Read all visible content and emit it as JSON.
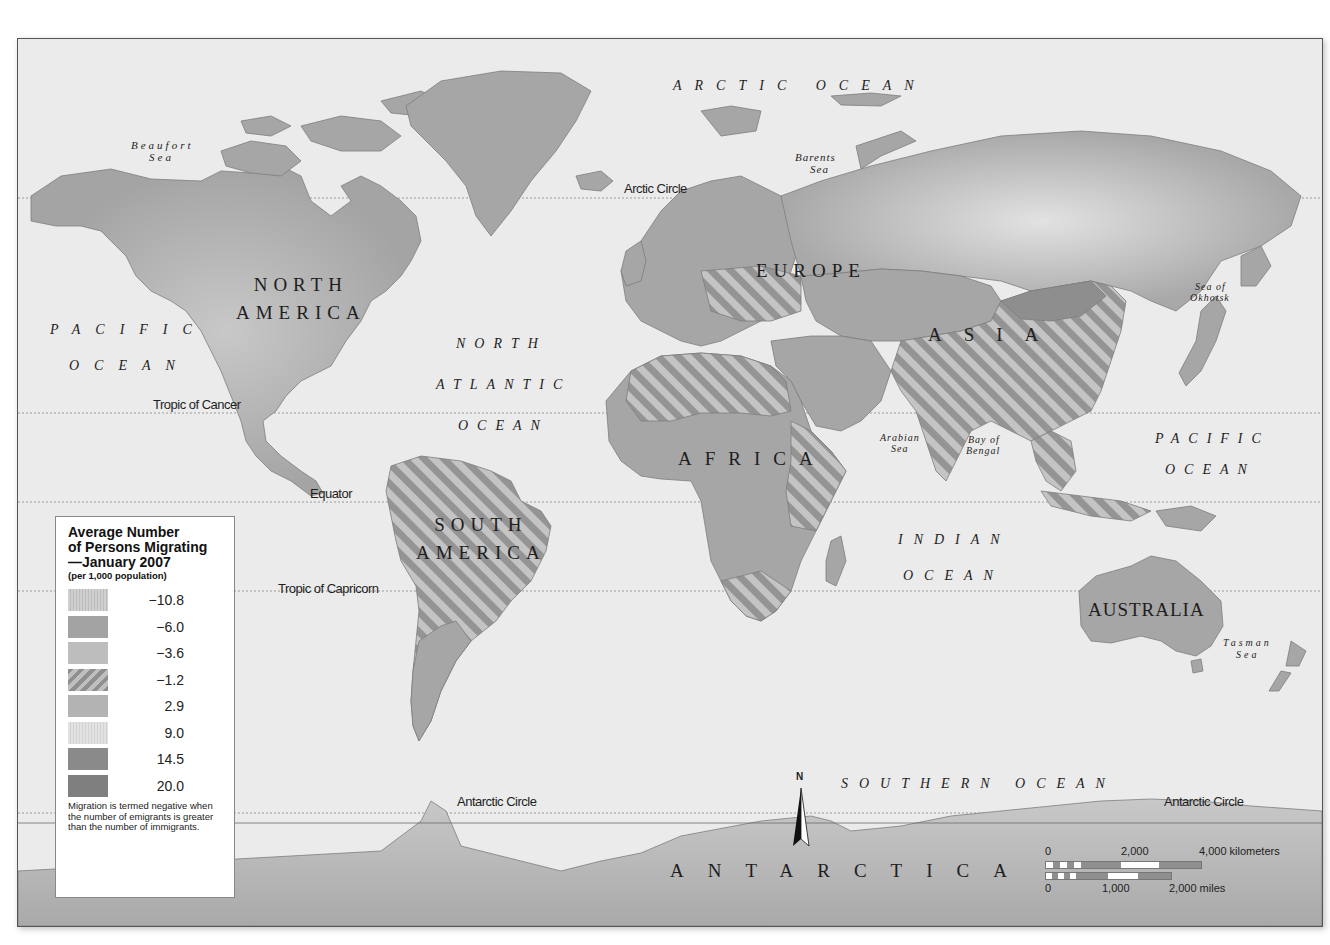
{
  "map": {
    "colors": {
      "ocean": "#ebebeb",
      "land": "#a6a6a6",
      "land_dark": "#8c8c8c",
      "hatch_light": "#c6c6c6",
      "hatch_dark": "#8f8f8f",
      "border": "#f0f0f0",
      "frame": "#555555"
    },
    "continents": {
      "north_america": "NORTH\nAMERICA",
      "south_america": "SOUTH\nAMERICA",
      "europe": "EUROPE",
      "asia": "ASIA",
      "africa": "AFRICA",
      "australia": "AUSTRALIA",
      "antarctica": "ANTARCTICA"
    },
    "oceans": {
      "arctic": "ARCTIC OCEAN",
      "pacific_west_1": "PACIFIC",
      "pacific_west_2": "OCEAN",
      "north_atlantic_1": "NORTH",
      "north_atlantic_2": "ATLANTIC",
      "north_atlantic_3": "OCEAN",
      "indian_1": "INDIAN",
      "indian_2": "OCEAN",
      "pacific_east_1": "PACIFIC",
      "pacific_east_2": "OCEAN",
      "southern": "SOUTHERN OCEAN"
    },
    "seas": {
      "beaufort_1": "Beaufort",
      "beaufort_2": "Sea",
      "barents_1": "Barents",
      "barents_2": "Sea",
      "okhotsk_1": "Sea of",
      "okhotsk_2": "Okhotsk",
      "arabian_1": "Arabian",
      "arabian_2": "Sea",
      "bengal_1": "Bay of",
      "bengal_2": "Bengal",
      "tasman_1": "Tasman",
      "tasman_2": "Sea"
    },
    "lines": {
      "arctic_circle": "Arctic Circle",
      "tropic_cancer": "Tropic of Cancer",
      "equator": "Equator",
      "tropic_capricorn": "Tropic of Capricorn",
      "antarctic_circle_west": "Antarctic Circle",
      "antarctic_circle_east": "Antarctic Circle"
    },
    "north_arrow": "N"
  },
  "legend": {
    "title_1": "Average Number",
    "title_2": "of Persons Migrating",
    "title_3": "—January 2007",
    "subtitle": "(per 1,000 population)",
    "items": [
      {
        "value": "−10.8",
        "pattern": "fine-light"
      },
      {
        "value": "−6.0",
        "pattern": "solid-medium"
      },
      {
        "value": "−3.6",
        "pattern": "solid-light"
      },
      {
        "value": "−1.2",
        "pattern": "diagonal-hatch"
      },
      {
        "value": "2.9",
        "pattern": "solid-mid-light"
      },
      {
        "value": "9.0",
        "pattern": "fine-very-light"
      },
      {
        "value": "14.5",
        "pattern": "solid-dark"
      },
      {
        "value": "20.0",
        "pattern": "solid-darker"
      }
    ],
    "note": "Migration is termed negative when the number of emigrants is greater than the number of immigrants."
  },
  "scale": {
    "km_0": "0",
    "km_mid": "2,000",
    "km_end": "4,000 kilometers",
    "mi_0": "0",
    "mi_mid": "1,000",
    "mi_end": "2,000 miles"
  }
}
